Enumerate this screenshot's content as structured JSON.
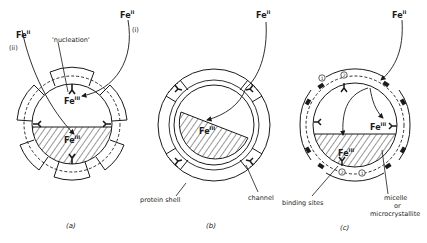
{
  "figure": {
    "panels": [
      {
        "id": "a",
        "caption": "(a)",
        "labels": {
          "fe_in_1": "Fe",
          "fe_in_1_sup": "II",
          "fe_in_2": "Fe",
          "fe_in_2_sup": "II",
          "path_i": "(i)",
          "path_ii": "(ii)",
          "nucleation": "'nucleation'",
          "fe_nuc": "Fe",
          "fe_nuc_sup": "III",
          "fe_core": "Fe",
          "fe_core_sup": "III"
        }
      },
      {
        "id": "b",
        "caption": "(b)",
        "labels": {
          "fe_in": "Fe",
          "fe_in_sup": "II",
          "fe_core": "Fe",
          "fe_core_sup": "III",
          "protein_shell": "protein shell",
          "channel": "channel"
        }
      },
      {
        "id": "c",
        "caption": "(c)",
        "labels": {
          "fe_in": "Fe",
          "fe_in_sup": "II",
          "fe_site": "Fe",
          "fe_site_sup": "III",
          "fe_core": "Fe",
          "fe_core_sup": "III",
          "binding_sites": "binding sites",
          "micelle": "micelle",
          "or": "or",
          "microcrystallite": "microcrystallite",
          "site_1": "1",
          "site_2": "2"
        }
      }
    ],
    "colors": {
      "ink": "#1a1a1a",
      "background": "#ffffff"
    }
  }
}
